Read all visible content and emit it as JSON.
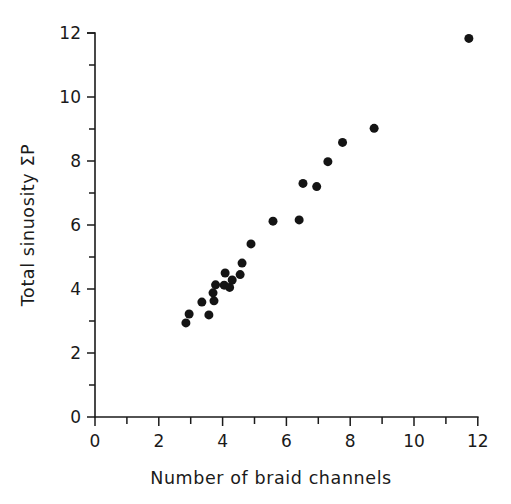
{
  "chart_data": {
    "type": "scatter",
    "title": "",
    "xlabel": "Number of braid channels",
    "ylabel": "Total sinuosity ΣP",
    "xlim": [
      0,
      12
    ],
    "ylim": [
      0,
      12
    ],
    "xticks": [
      0,
      1,
      2,
      3,
      4,
      5,
      6,
      7,
      8,
      9,
      10,
      11,
      12
    ],
    "yticks": [
      0,
      1,
      2,
      3,
      4,
      5,
      6,
      7,
      8,
      9,
      10,
      11,
      12
    ],
    "xtick_labels": [
      "0",
      "",
      "2",
      "",
      "4",
      "",
      "6",
      "",
      "8",
      "",
      "10",
      "",
      "12"
    ],
    "ytick_labels": [
      "0",
      "",
      "2",
      "",
      "4",
      "",
      "6",
      "",
      "8",
      "",
      "10",
      "",
      "12"
    ],
    "grid": false,
    "legend": "none",
    "marker": "filled-circle",
    "marker_color": "#141414",
    "marker_size_px": 9,
    "n_points": 23,
    "points": [
      {
        "x": 2.85,
        "y": 2.94
      },
      {
        "x": 2.95,
        "y": 3.22
      },
      {
        "x": 3.35,
        "y": 3.59
      },
      {
        "x": 3.57,
        "y": 3.19
      },
      {
        "x": 3.7,
        "y": 3.88
      },
      {
        "x": 3.73,
        "y": 3.63
      },
      {
        "x": 3.78,
        "y": 4.13
      },
      {
        "x": 4.05,
        "y": 4.12
      },
      {
        "x": 4.08,
        "y": 4.5
      },
      {
        "x": 4.22,
        "y": 4.05
      },
      {
        "x": 4.3,
        "y": 4.28
      },
      {
        "x": 4.55,
        "y": 4.45
      },
      {
        "x": 4.61,
        "y": 4.81
      },
      {
        "x": 4.89,
        "y": 5.41
      },
      {
        "x": 5.58,
        "y": 6.12
      },
      {
        "x": 6.4,
        "y": 6.16
      },
      {
        "x": 6.52,
        "y": 7.3
      },
      {
        "x": 6.95,
        "y": 7.2
      },
      {
        "x": 7.3,
        "y": 7.98
      },
      {
        "x": 7.76,
        "y": 8.58
      },
      {
        "x": 8.75,
        "y": 9.02
      },
      {
        "x": 11.72,
        "y": 11.83
      }
    ]
  },
  "axes": {
    "x_title": "Number of braid channels",
    "y_title": "Total sinuosity ΣP"
  },
  "colors": {
    "background": "#ffffff",
    "ink": "#1a1a1a",
    "marker": "#141414"
  }
}
